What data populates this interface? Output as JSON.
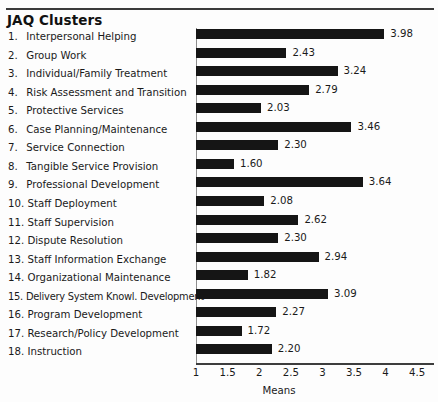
{
  "figure": {
    "title": "JAQ Clusters",
    "axis_title": "Means"
  },
  "chart_data": {
    "type": "bar",
    "orientation": "horizontal",
    "title": "JAQ Clusters",
    "xlabel": "Means",
    "ylabel": "",
    "xlim": [
      1,
      4.5
    ],
    "grid": false,
    "legend": null,
    "xticks": [
      "1",
      "1.5",
      "2",
      "2.5",
      "3",
      "3.5",
      "4",
      "4.5"
    ],
    "xtick_values": [
      1,
      1.5,
      2,
      2.5,
      3,
      3.5,
      4,
      4.5
    ],
    "bar_color": "#151515",
    "categories": [
      "Interpersonal Helping",
      "Group Work",
      "Individual/Family Treatment",
      "Risk Assessment and Transition",
      "Protective Services",
      "Case Planning/Maintenance",
      "Service Connection",
      "Tangible Service Provision",
      "Professional Development",
      "Staff Deployment",
      "Staff Supervision",
      "Dispute Resolution",
      "Staff Information Exchange",
      "Organizational Maintenance",
      "Delivery System Knowl. Development",
      "Program Development",
      "Research/Policy Development",
      "Instruction"
    ],
    "values": [
      3.98,
      2.43,
      3.24,
      2.79,
      2.03,
      3.46,
      2.3,
      1.6,
      3.64,
      2.08,
      2.62,
      2.3,
      2.94,
      1.82,
      3.09,
      2.27,
      1.72,
      2.2
    ],
    "value_labels": [
      "3.98",
      "2.43",
      "3.24",
      "2.79",
      "2.03",
      "3.46",
      "2.30",
      "1.60",
      "3.64",
      "2.08",
      "2.62",
      "2.30",
      "2.94",
      "1.82",
      "3.09",
      "2.27",
      "1.72",
      "2.20"
    ],
    "item_numbers": [
      "1.",
      "2.",
      "3.",
      "4.",
      "5.",
      "6.",
      "7.",
      "8.",
      "9.",
      "10.",
      "11.",
      "12.",
      "13.",
      "14.",
      "15.",
      "16.",
      "17.",
      "18."
    ]
  }
}
